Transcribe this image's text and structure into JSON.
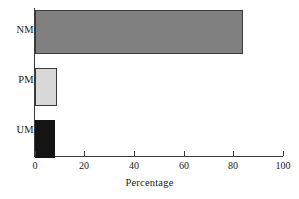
{
  "chart_data": {
    "type": "bar",
    "orientation": "horizontal",
    "title": "",
    "xlabel": "Percentage",
    "ylabel": "",
    "categories": [
      "NM",
      "PM",
      "UM"
    ],
    "values": [
      84,
      9,
      8
    ],
    "bar_colors": [
      "#808080",
      "#d8d8d8",
      "#141414"
    ],
    "bar_border_color": "#3a3a3a",
    "xlim": [
      0,
      100
    ],
    "xticks": [
      0,
      20,
      40,
      60,
      80,
      100
    ],
    "xtick_labels": [
      "0",
      "20",
      "40",
      "60",
      "80",
      "100"
    ],
    "grid": false,
    "legend": null,
    "axis_color": "#3a3a3a",
    "background": "#ffffff"
  },
  "labels": {
    "nm": "NM",
    "pm": "PM",
    "um": "UM"
  },
  "ticks": {
    "t0": "0",
    "t20": "20",
    "t40": "40",
    "t60": "60",
    "t80": "80",
    "t100": "100"
  },
  "axis": {
    "x_title": "Percentage"
  }
}
